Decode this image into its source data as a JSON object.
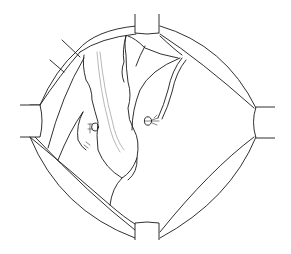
{
  "figure": {
    "colors": {
      "stroke": "#1a1a1a",
      "background": "#ffffff",
      "vessel": "#888888"
    },
    "elements": [
      {
        "name": "retractor-ring",
        "kind": "outline"
      },
      {
        "name": "retractor-blade-top"
      },
      {
        "name": "retractor-blade-bottom"
      },
      {
        "name": "retractor-blade-left"
      },
      {
        "name": "retractor-blade-right"
      },
      {
        "name": "retracted-bowel-loop"
      },
      {
        "name": "clip-left"
      },
      {
        "name": "clip-right"
      },
      {
        "name": "drain-tube"
      }
    ]
  }
}
